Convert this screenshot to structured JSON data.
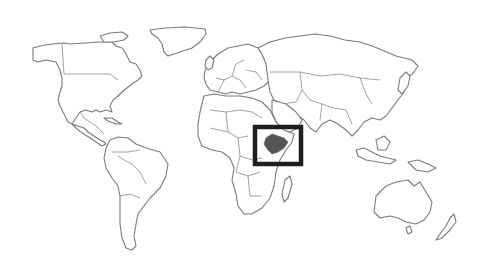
{
  "map": {
    "type": "world-political-outline",
    "highlighted_country": "Ethiopia",
    "colors": {
      "background": "#ffffff",
      "land_fill": "#ffffff",
      "border": "#7a7a7a",
      "highlight_fill": "#555555",
      "highlight_box": "#1e1e1e"
    },
    "highlight_box": {
      "x": 255,
      "y": 127,
      "width": 46,
      "height": 37
    }
  }
}
